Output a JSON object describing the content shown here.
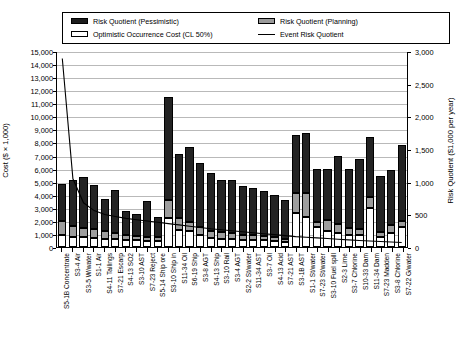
{
  "legend": {
    "items": [
      {
        "label": "Risk Quotient (Pessimistic)",
        "swatch": "pessimistic-swatch",
        "color": "#232323"
      },
      {
        "label": "Risk Quotient (Planning)",
        "swatch": "planning-swatch",
        "color": "#9d9d9d"
      },
      {
        "label": "Optimistic Occurrence Cost (CL 50%)",
        "swatch": "optimistic-swatch",
        "color": "#ffffff"
      },
      {
        "label": "Event Risk Quotient",
        "swatch": "line-swatch",
        "color": "#000000"
      }
    ]
  },
  "chart_data": {
    "type": "bar",
    "subtype": "stacked-bar-with-line",
    "title": "",
    "xlabel": "",
    "ylabel": "Cost ($ × 1,000)",
    "y2label": "Risk Quotient ($1,000 per year)",
    "ylim": [
      0,
      15000
    ],
    "y2lim": [
      0,
      3000
    ],
    "ytick_labels": [
      "15,000",
      "14,000",
      "13,000",
      "12,000",
      "11,000",
      "10,000",
      "9,000",
      "8,000",
      "7,000",
      "6,000",
      "5,000",
      "4,000",
      "3,000",
      "2,000",
      "1,000",
      "0"
    ],
    "y2tick_labels": [
      "3,000",
      "2,500",
      "2,000",
      "1,500",
      "1,000",
      "500",
      "0"
    ],
    "grid": true,
    "legend_position": "top",
    "categories": [
      "S5-1B Concentrate",
      "S3-4 Air",
      "S3-5 W/water",
      "S1-1 Air",
      "S4-11 Tailings",
      "S7-21 Escarp",
      "S4-13 SO2",
      "S3-10 AST",
      "S7-23 Reject",
      "S5-14 Ship ore",
      "S3-10 Ship in",
      "S11-34 Oil",
      "S6-19 Ship",
      "S3-8 AGT",
      "S4-13 Ship",
      "S3-10 Rail",
      "S3-4 AGT",
      "S2-2 St/water",
      "S11-34 AST",
      "S3-7 Oil",
      "S4-13 Acid",
      "S7-21 AST",
      "S3-1B AST",
      "S1-1 St/water",
      "S7-23 St/water",
      "S3-10 Fuel spill",
      "S2-3 Lime",
      "S3-7 Chlorine",
      "S10-33 Dam",
      "S11-34 Dam",
      "S7-23 Madden",
      "S3-8 Chlorine",
      "S7-22 G/water"
    ],
    "series": [
      {
        "name": "Optimistic Occurrence Cost (CL 50%)",
        "stack": "cost",
        "order": 1,
        "values": [
          900,
          800,
          750,
          700,
          650,
          600,
          550,
          500,
          480,
          450,
          2200,
          1300,
          1250,
          950,
          700,
          650,
          600,
          550,
          520,
          500,
          480,
          400,
          2600,
          2300,
          1500,
          1200,
          1100,
          950,
          900,
          3000,
          800,
          1100,
          1500
        ]
      },
      {
        "name": "Risk Quotient (Planning)",
        "stack": "cost",
        "order": 2,
        "values": [
          1100,
          800,
          700,
          650,
          600,
          450,
          400,
          350,
          320,
          300,
          1400,
          900,
          700,
          600,
          550,
          500,
          450,
          400,
          380,
          350,
          300,
          250,
          1500,
          1800,
          400,
          900,
          700,
          500,
          450,
          800,
          350,
          600,
          500
        ]
      },
      {
        "name": "Risk Quotient (Pessimistic)",
        "stack": "cost",
        "order": 3,
        "values": [
          2800,
          3500,
          3900,
          3400,
          2450,
          3300,
          1800,
          1700,
          2700,
          1550,
          7900,
          4900,
          5700,
          4900,
          4400,
          4000,
          4100,
          3750,
          3600,
          3400,
          3200,
          2950,
          4500,
          4600,
          4100,
          3900,
          5200,
          4500,
          5400,
          4600,
          4300,
          4200,
          5800
        ]
      }
    ],
    "line_series": {
      "name": "Event Risk Quotient",
      "axis": "right",
      "values": [
        2900,
        1050,
        680,
        560,
        500,
        470,
        440,
        420,
        400,
        380,
        360,
        340,
        320,
        300,
        280,
        265,
        250,
        235,
        220,
        205,
        190,
        175,
        160,
        150,
        140,
        130,
        120,
        110,
        100,
        92,
        85,
        78,
        70
      ]
    }
  }
}
